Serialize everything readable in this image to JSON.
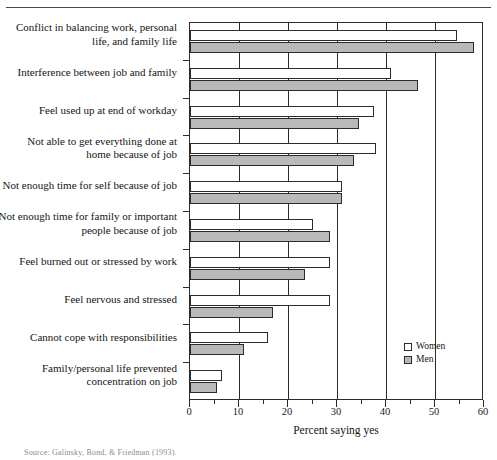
{
  "figure": {
    "axis_title": "Percent saying yes",
    "caption_fragment": "Source: Galinsky, Bond, & Friedman (1993)."
  },
  "legend": {
    "position": "bottom-right-inside",
    "entries": [
      {
        "label": "Women",
        "color": "#ffffff"
      },
      {
        "label": "Men",
        "color": "#b9b9b9"
      }
    ]
  },
  "axis": {
    "tick_labels": [
      "0",
      "10",
      "20",
      "30",
      "40",
      "50",
      "60"
    ],
    "minor_tick_values": [
      5,
      15,
      25,
      35,
      45,
      55
    ]
  },
  "chart_data": {
    "type": "bar",
    "orientation": "horizontal",
    "title": "",
    "subtitle": "",
    "xlabel": "Percent saying yes",
    "ylabel": "",
    "xlim": [
      0,
      60
    ],
    "xticks": [
      0,
      10,
      20,
      30,
      40,
      50,
      60
    ],
    "grid": "vertical-major-only",
    "legend_position": "lower right (inside axes)",
    "categories": [
      "Conflict in balancing work, personal life, and family life",
      "Interference between job and family",
      "Feel used up at end of workday",
      "Not able to get everything done at home because of job",
      "Not enough time for self because of job",
      "Not enough time for family or important people because of job",
      "Feel burned out or stressed by work",
      "Feel nervous and stressed",
      "Cannot cope with responsibilities",
      "Family/personal life prevented concentration on job"
    ],
    "category_lines": [
      [
        "Conflict in balancing work, personal",
        "life, and family life"
      ],
      [
        "Interference between job and family"
      ],
      [
        "Feel used up at end of workday"
      ],
      [
        "Not able to get everything done at",
        "home because of job"
      ],
      [
        "Not enough time for self because of job"
      ],
      [
        "Not enough time for family or important",
        "people because of job"
      ],
      [
        "Feel burned out or stressed by work"
      ],
      [
        "Feel nervous and stressed"
      ],
      [
        "Cannot cope with responsibilities"
      ],
      [
        "Family/personal life prevented",
        "concentration on job"
      ]
    ],
    "series": [
      {
        "name": "Women",
        "color": "#ffffff",
        "values": [
          54.5,
          41,
          37.5,
          38,
          31,
          25,
          28.5,
          28.5,
          16,
          6.5
        ]
      },
      {
        "name": "Men",
        "color": "#b9b9b9",
        "values": [
          58,
          46.5,
          34.5,
          33.5,
          31,
          28.5,
          23.5,
          17,
          11,
          5.5
        ]
      }
    ]
  }
}
